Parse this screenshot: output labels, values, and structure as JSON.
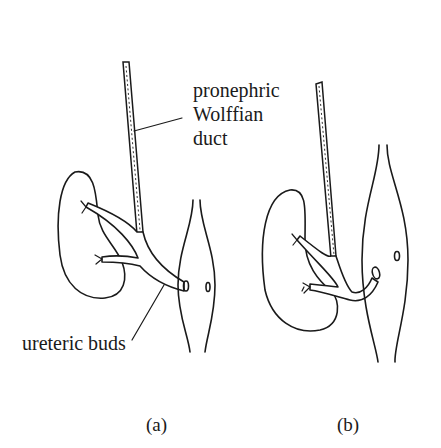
{
  "figure": {
    "labels": {
      "duct_line1": "pronephric",
      "duct_line2": "Wolffian",
      "duct_line3": "duct",
      "buds": "ureteric buds",
      "panel_a": "(a)",
      "panel_b": "(b)"
    },
    "colors": {
      "ink": "#1a1a1a",
      "background": "#ffffff"
    }
  }
}
